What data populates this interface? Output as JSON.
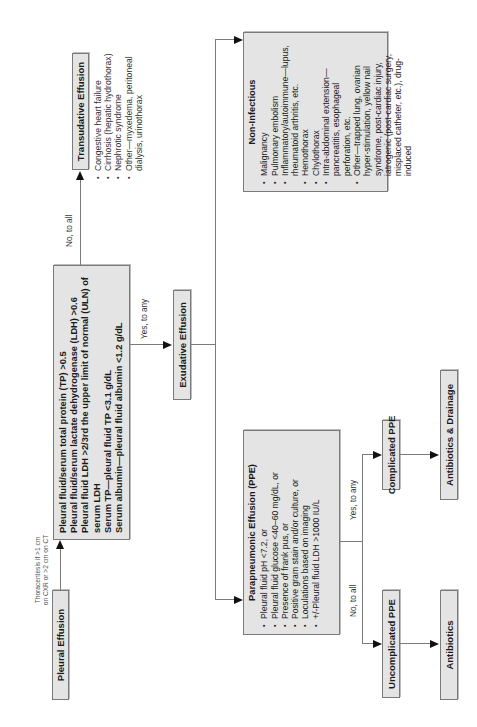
{
  "diagram": {
    "orientation": "rotated-90-ccw",
    "nodes": {
      "pleural_effusion": {
        "label": "Pleural Effusion"
      },
      "thoracentesis_label": {
        "line1": "Thoracentesis if >1 cm",
        "line2": "on CXR or >2 cm on CT"
      },
      "criteria": {
        "lines": [
          "Pleural fluid/serum total protein (TP) >0.5",
          "Pleural fluid/serum lactate dehydrogenase (LDH) >0.6",
          "Pleural fluid LDH >2/3rd the upper limit of normal (ULN) of serum LDH",
          "Serum TP—pleural fluid TP <3.1 g/dL",
          "Serum albumin—pleural fluid albumin <1.2 g/dL"
        ]
      },
      "transudative": {
        "label": "Transudative Effusion",
        "edge_label": "No, to all",
        "causes": [
          "Congestive heart failure",
          "Cirrhosis (hepatic hydrothorax)",
          "Nephrotic syndrome",
          "Other—myxedema, peritoneal dialysis, urinothorax"
        ]
      },
      "exudative": {
        "label": "Exudative Effusion",
        "edge_label": "Yes, to any"
      },
      "non_infectious": {
        "title": "Non-Infectious",
        "items": [
          "Malignancy",
          "Pulmonary embolism",
          "Inflammatory/autoimmune—lupus, rheumatoid arthritis, etc.",
          "Hemothorax",
          "Chylothorax",
          "Intra-abdominal extension—pancreatitis, esophageal perforation, etc.",
          "Other—trapped lung, ovarian hyper-stimulation, yellow nail syndrome, post-cardiac injury, iatrogenic (post-cardiac surgery, misplaced catheter, etc.), drug-induced"
        ]
      },
      "ppe": {
        "title": "Parapneumonic Effusion (PPE)",
        "items": [
          "Pleural fluid pH <7.2, or",
          "Pleural fluid glucose <40–60 mg/dL, or",
          "Presence of frank pus, or",
          "Positive gram stain and/or culture, or",
          "Loculations based on imaging",
          "+/-Pleural fluid LDH >1000 IU/L"
        ]
      },
      "uncomplicated": {
        "label": "Uncomplicated PPE",
        "edge_label": "No, to all"
      },
      "complicated": {
        "label": "Complicated PPE",
        "edge_label": "Yes, to any"
      },
      "antibiotics": {
        "label": "Antibiotics"
      },
      "antibiotics_drainage": {
        "label": "Antibiotics & Drainage"
      }
    },
    "colors": {
      "box_fill": "#e4e4e4",
      "box_border": "#7a7a7a",
      "line": "#7a7a7a",
      "arrow": "#111111"
    }
  }
}
